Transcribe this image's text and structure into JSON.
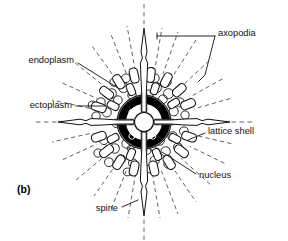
{
  "figure": {
    "panel_label": "(b)",
    "background_color": "#ffffff",
    "ink_color": "#111111"
  },
  "labels": {
    "axopodia": "axopodia",
    "endoplasm": "endoplasm",
    "ectoplasm": "ectoplasm",
    "lattice_shell": "lattice shell",
    "nucleus": "nucleus",
    "spine": "spine"
  },
  "structures": [
    {
      "name": "axopodia",
      "kind": "radiating-dashed-rays",
      "note": "fine dashed rays extending outward in all directions"
    },
    {
      "name": "endoplasm",
      "kind": "inner-granular-zone",
      "note": "zone of C-shaped vacuole marks inside the lattice shell"
    },
    {
      "name": "ectoplasm",
      "kind": "outer-cytoplasm-layer",
      "note": "outer layer beyond the shell"
    },
    {
      "name": "lattice shell",
      "kind": "perforated-skeletal-ring",
      "note": "ring of short rounded-rectangle segments"
    },
    {
      "name": "nucleus",
      "kind": "central-white-circle",
      "note": "white circle at the centre of the central capsule"
    },
    {
      "name": "spine",
      "kind": "axial-needle",
      "note": "four tapering needles on the vertical and horizontal axes"
    }
  ],
  "leader_lines": {
    "axopodia": "bracket-with-two-arms",
    "endoplasm": "diagonal-down-right",
    "ectoplasm": "horizontal-right",
    "lattice_shell": "diagonal-up-left",
    "nucleus": "diagonal-up-left",
    "spine": "diagonal-up-right"
  }
}
